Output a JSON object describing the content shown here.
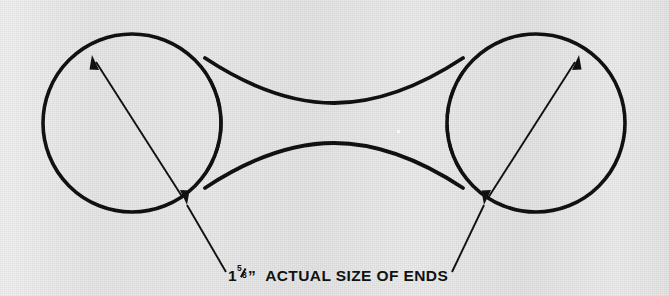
{
  "figure": {
    "background_color": "#e9e9e9",
    "ink_color": "#111111",
    "shape": {
      "name": "dumbbell",
      "description": "Two equal circles joined by a concave waist",
      "left_circle": {
        "cx": 132,
        "cy": 123,
        "r": 89
      },
      "right_circle": {
        "cx": 536,
        "cy": 123,
        "r": 89
      },
      "waist_min_half_height": 31
    },
    "hidden_edges": [
      {
        "name": "left-dashed-arc",
        "cx": 132,
        "cy": 123,
        "r": 89
      },
      {
        "name": "right-dashed-arc",
        "cx": 536,
        "cy": 123,
        "r": 89
      }
    ],
    "dimension_arrows": [
      {
        "name": "left-diameter-arrow",
        "x1": 93,
        "y1": 57,
        "x2": 186,
        "y2": 203,
        "double_headed": true
      },
      {
        "name": "right-diameter-arrow",
        "x1": 578,
        "y1": 57,
        "x2": 485,
        "y2": 203,
        "double_headed": true
      }
    ],
    "leader_lines": [
      {
        "name": "left-leader-line",
        "x1": 186,
        "y1": 203,
        "x2": 227,
        "y2": 272
      },
      {
        "name": "right-leader-line",
        "x1": 485,
        "y1": 203,
        "x2": 452,
        "y2": 272
      }
    ],
    "caption": {
      "measurement_whole": "1",
      "measurement_numerator": "5",
      "measurement_denominator": "8",
      "inch_symbol": "”",
      "label": "ACTUAL SIZE OF ENDS",
      "full_text": "1 5/8”  ACTUAL SIZE OF ENDS"
    },
    "artifacts": [
      {
        "name": "white-speck",
        "x": 397,
        "y": 130
      }
    ]
  }
}
